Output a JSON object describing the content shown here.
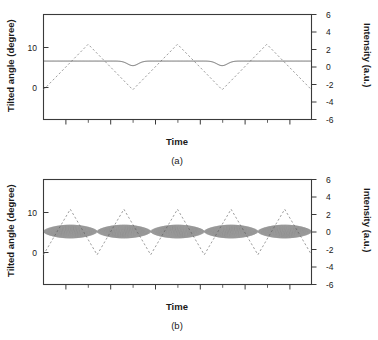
{
  "figure": {
    "title": "",
    "panels": [
      {
        "id": "a",
        "caption": "(a)",
        "xlabel": "Time",
        "ylabel_left": "Tilted angle (degree)",
        "ylabel_right": "Intensity (a.u.)"
      },
      {
        "id": "b",
        "caption": "(b)",
        "xlabel": "Time",
        "ylabel_left": "Tilted angle (degree)",
        "ylabel_right": "Intensity (a.u.)"
      }
    ]
  },
  "axes": {
    "left_ticks": [
      "10",
      "0"
    ],
    "left_tick_values": [
      10,
      0
    ],
    "right_ticks": [
      "6",
      "4",
      "2",
      "0",
      "-2",
      "-4",
      "-6"
    ],
    "right_tick_values": [
      6,
      4,
      2,
      0,
      -2,
      -4,
      -6
    ],
    "left_range": [
      -5.5,
      17.5
    ],
    "right_range": [
      -6,
      6
    ],
    "x_major_tick_count": 6,
    "x_minor_tick_count": 6
  },
  "colors": {
    "frame": "#3a3a3a",
    "solid_curve": "#4d4d4d",
    "dashed_curve": "#8c8c8c",
    "band_curve": "#5a5a5a",
    "text": "#1a1a1a",
    "background": "#ffffff"
  },
  "chart_data": [
    {
      "type": "line",
      "panel": "a",
      "title": "(a)",
      "xlabel": "Time",
      "ylabel": "Tilted angle (degree)",
      "ylabel_secondary": "Intensity (a.u.)",
      "xlim": [
        0,
        1
      ],
      "ylim": [
        -5.5,
        17.5
      ],
      "ylim_secondary": [
        -6,
        6
      ],
      "yticks": [
        0,
        10
      ],
      "yticks_secondary": [
        -6,
        -4,
        -2,
        0,
        2,
        4,
        6
      ],
      "grid": false,
      "legend": "none",
      "series": [
        {
          "name": "Tilted angle",
          "style": "solid",
          "axis": "left",
          "description": "Nearly flat line near 7.3 degrees with small downward dips coinciding with each triangle-wave trough",
          "baseline": 7.3,
          "dip_depth": 1.0,
          "dip_count": 3,
          "values_note": "y = 7.3 - 1.0*exp(-((x - x_dip)/0.028)^2) summed over dips at x = 0.165, 0.50, 0.835"
        },
        {
          "name": "Intensity",
          "style": "dashed",
          "axis": "right",
          "description": "Triangular (sawtooth-symmetric) wave, 3 full periods across the time axis",
          "waveform": "triangle",
          "periods": 3,
          "amplitude": 2.6,
          "offset": 0.0,
          "peak_value": 2.6,
          "trough_value": -2.6,
          "phase_start_value": -2.6
        }
      ]
    },
    {
      "type": "line",
      "panel": "b",
      "title": "(b)",
      "xlabel": "Time",
      "ylabel": "Tilted angle (degree)",
      "ylabel_secondary": "Intensity (a.u.)",
      "xlim": [
        0,
        1
      ],
      "ylim": [
        -5.5,
        17.5
      ],
      "ylim_secondary": [
        -6,
        6
      ],
      "yticks": [
        0,
        10
      ],
      "yticks_secondary": [
        -6,
        -4,
        -2,
        0,
        2,
        4,
        6
      ],
      "grid": false,
      "legend": "none",
      "series": [
        {
          "name": "Tilted angle",
          "style": "solid-dense-oscillation",
          "axis": "left",
          "description": "Dense high-frequency oscillation forming a thick dark band with lens-shaped (spindle) envelopes; narrow necks at each triangle-wave trough",
          "baseline": 6.1,
          "envelope_max": 1.5,
          "envelope_min": 0.05,
          "lens_count": 5,
          "carrier_cycles": 260,
          "values_note": "y = 6.1 + A(x)*sin(2*pi*260*x), A(x) = 1.5*|sin(5*pi*x)|^0.55 with sharp necks at x = 0.1, 0.3, 0.5, 0.7, 0.9"
        },
        {
          "name": "Intensity",
          "style": "dashed",
          "axis": "right",
          "description": "Triangular wave, 5 full periods across the time axis",
          "waveform": "triangle",
          "periods": 5,
          "amplitude": 2.6,
          "offset": 0.0,
          "peak_value": 2.6,
          "trough_value": -2.6,
          "phase_start_value": -2.6
        }
      ]
    }
  ]
}
